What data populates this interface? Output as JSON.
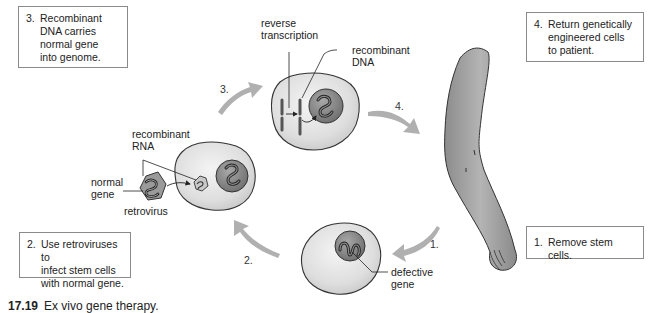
{
  "figure": {
    "title": "Ex vivo gene therapy",
    "caption_number": "17.19",
    "caption_text": "Ex vivo gene therapy."
  },
  "steps": [
    {
      "number": "1.",
      "text": "Remove stem cells."
    },
    {
      "number": "2.",
      "text": "Use retroviruses to\ninfect stem cells\nwith normal gene."
    },
    {
      "number": "3.",
      "text": "Recombinant\nDNA carries\nnormal gene\ninto genome."
    },
    {
      "number": "4.",
      "text": "Return genetically\nengineered cells\nto patient."
    }
  ],
  "arrow_labels": {
    "arrow_1": "1.",
    "arrow_2": "2.",
    "arrow_3": "3.",
    "arrow_4": "4."
  },
  "labels": {
    "reverse_transcription": "reverse\ntranscription",
    "recombinant_dna": "recombinant\nDNA",
    "recombinant_rna": "recombinant\nRNA",
    "normal_gene": "normal\ngene",
    "retrovirus": "retrovirus",
    "defective_gene": "defective\ngene"
  },
  "colors": {
    "cell_fill": "#e4e4e4",
    "cell_outline": "#3a3a3a",
    "nucleus_fill": "#8c8c8c",
    "arrow": "#a9a9a9",
    "arm_fill": "#9e9e9e",
    "box_border": "#8a8a8a"
  }
}
